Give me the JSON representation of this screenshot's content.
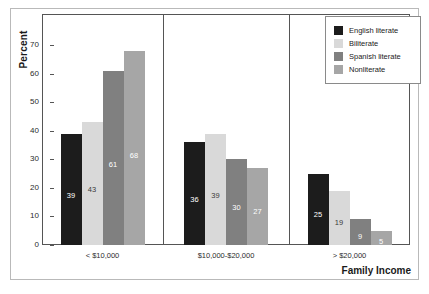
{
  "chart_data": {
    "type": "bar",
    "title": "",
    "xlabel": "Family Income",
    "ylabel": "Percent",
    "categories": [
      "< $10,000",
      "$10,000-$20,000",
      "> $20,000"
    ],
    "series": [
      {
        "name": "English literate",
        "color": "#1c1c1c",
        "values": [
          39,
          36,
          25
        ]
      },
      {
        "name": "Biliterate",
        "color": "#d9d9d9",
        "values": [
          43,
          39,
          19
        ]
      },
      {
        "name": "Spanish literate",
        "color": "#808080",
        "values": [
          61,
          30,
          9
        ]
      },
      {
        "name": "Nonliterate",
        "color": "#a6a6a6",
        "values": [
          68,
          27,
          5
        ]
      }
    ],
    "ylim": [
      0,
      75
    ],
    "yticks": [
      0,
      10,
      20,
      30,
      40,
      50,
      60,
      70
    ],
    "grid": false,
    "legend_position": "top-right",
    "panel_dividers": true
  },
  "axis": {
    "y_title": "Percent",
    "x_title": "Family Income",
    "y_tick_labels": [
      "70",
      "60",
      "50",
      "40",
      "30",
      "20",
      "10",
      "0"
    ]
  },
  "legend": {
    "items": [
      {
        "label": "English literate",
        "color": "#1c1c1c"
      },
      {
        "label": "Biliterate",
        "color": "#d9d9d9"
      },
      {
        "label": "Spanish literate",
        "color": "#808080"
      },
      {
        "label": "Nonliterate",
        "color": "#a6a6a6"
      }
    ]
  },
  "groups": [
    {
      "label": "< $10,000",
      "bars": [
        {
          "series": "English literate",
          "value": 39,
          "label": "39",
          "color": "#1c1c1c",
          "label_color": "light"
        },
        {
          "series": "Biliterate",
          "value": 43,
          "label": "43",
          "color": "#d9d9d9",
          "label_color": "dark"
        },
        {
          "series": "Spanish literate",
          "value": 61,
          "label": "61",
          "color": "#808080",
          "label_color": "light"
        },
        {
          "series": "Nonliterate",
          "value": 68,
          "label": "68",
          "color": "#a6a6a6",
          "label_color": "light"
        }
      ]
    },
    {
      "label": "$10,000-$20,000",
      "bars": [
        {
          "series": "English literate",
          "value": 36,
          "label": "36",
          "color": "#1c1c1c",
          "label_color": "light"
        },
        {
          "series": "Biliterate",
          "value": 39,
          "label": "39",
          "color": "#d9d9d9",
          "label_color": "dark"
        },
        {
          "series": "Spanish literate",
          "value": 30,
          "label": "30",
          "color": "#808080",
          "label_color": "light"
        },
        {
          "series": "Nonliterate",
          "value": 27,
          "label": "27",
          "color": "#a6a6a6",
          "label_color": "light"
        }
      ]
    },
    {
      "label": "> $20,000",
      "bars": [
        {
          "series": "English literate",
          "value": 25,
          "label": "25",
          "color": "#1c1c1c",
          "label_color": "light"
        },
        {
          "series": "Biliterate",
          "value": 19,
          "label": "19",
          "color": "#d9d9d9",
          "label_color": "dark"
        },
        {
          "series": "Spanish literate",
          "value": 9,
          "label": "9",
          "color": "#808080",
          "label_color": "light"
        },
        {
          "series": "Nonliterate",
          "value": 5,
          "label": "5",
          "color": "#a6a6a6",
          "label_color": "light"
        }
      ]
    }
  ]
}
